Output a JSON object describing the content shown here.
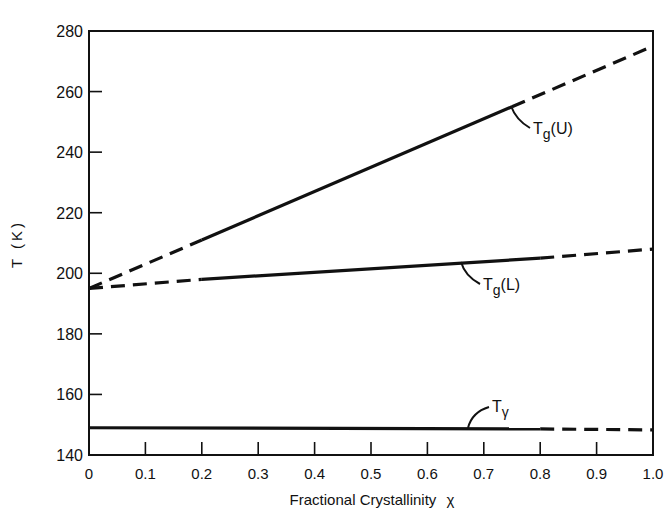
{
  "chart_data": {
    "type": "line",
    "title": "",
    "xlabel": "Fractional Crystallinity",
    "xlabel_symbol": "χ",
    "ylabel": "T (K)",
    "xlim": [
      0,
      1.0
    ],
    "ylim": [
      140,
      280
    ],
    "grid": false,
    "legend": "none (inline curve labels)",
    "x_ticks": [
      "0",
      "0.1",
      "0.2",
      "0.3",
      "0.4",
      "0.5",
      "0.6",
      "0.7",
      "0.8",
      "0.9",
      "1.0"
    ],
    "y_ticks": [
      "140",
      "160",
      "180",
      "200",
      "220",
      "240",
      "260",
      "280"
    ],
    "series": [
      {
        "name": "Tg(U)",
        "label_main": "T",
        "label_sub": "g",
        "label_suffix": "(U)",
        "x": [
          0,
          0.2,
          0.8,
          1.0
        ],
        "y": [
          195,
          211,
          259,
          275
        ],
        "solid_range": [
          0.2,
          0.75
        ],
        "dashed_elsewhere": true
      },
      {
        "name": "Tg(L)",
        "label_main": "T",
        "label_sub": "g",
        "label_suffix": "(L)",
        "x": [
          0,
          0.2,
          0.8,
          1.0
        ],
        "y": [
          195,
          198,
          205,
          208
        ],
        "solid_range": [
          0.2,
          0.8
        ],
        "dashed_elsewhere": true
      },
      {
        "name": "Tγ",
        "label_main": "T",
        "label_sub": "γ",
        "label_suffix": "",
        "x": [
          0,
          0.8,
          1.0
        ],
        "y": [
          149,
          148.6,
          148.3
        ],
        "solid_range": [
          0,
          0.8
        ],
        "dashed_elsewhere": true
      }
    ]
  }
}
